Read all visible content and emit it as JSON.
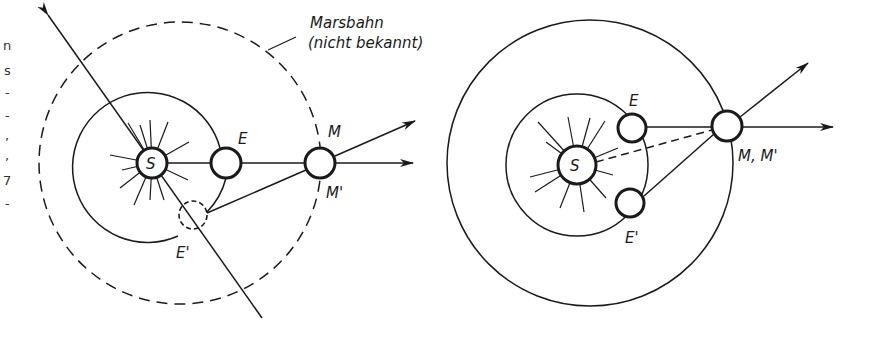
{
  "left_diagram": {
    "orbit_label_line1": "Marsbahn",
    "orbit_label_line2": "(nicht bekannt)",
    "sun_label": "S",
    "earth_label": "E",
    "earth_prime_label": "E'",
    "mars_label": "M",
    "mars_prime_label": "M'"
  },
  "right_diagram": {
    "sun_label": "S",
    "earth_label": "E",
    "earth_prime_label": "E'",
    "mars_label": "M, M'"
  },
  "margin_text_fragments": [
    "n",
    "s",
    "-",
    "-",
    ",",
    ",",
    "7",
    "-"
  ],
  "colors": {
    "ink": "#1a1a1a",
    "paper": "#ffffff"
  }
}
